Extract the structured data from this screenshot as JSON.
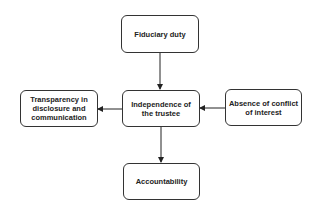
{
  "diagram": {
    "nodes": [
      {
        "id": "fiduciary",
        "label": "Fiduciary duty"
      },
      {
        "id": "independence",
        "label": "Independence of the trustee"
      },
      {
        "id": "transparency",
        "label": "Transparency in disclosure and communication"
      },
      {
        "id": "absence",
        "label": "Absence of conflict of interest"
      },
      {
        "id": "accountability",
        "label": "Accountability"
      }
    ],
    "edges": [
      {
        "from": "fiduciary",
        "to": "independence"
      },
      {
        "from": "absence",
        "to": "independence"
      },
      {
        "from": "independence",
        "to": "transparency"
      },
      {
        "from": "independence",
        "to": "accountability"
      }
    ]
  }
}
